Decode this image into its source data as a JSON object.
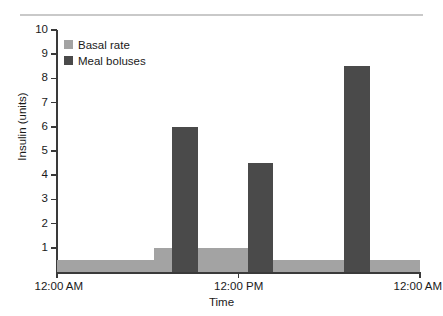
{
  "chart_data": {
    "type": "bar",
    "title": "",
    "xlabel": "Time",
    "ylabel": "Insulin (units)",
    "ylim": [
      0,
      10
    ],
    "y_ticks": [
      1,
      2,
      3,
      4,
      5,
      6,
      7,
      8,
      9,
      10
    ],
    "y_tick_labels": [
      "1",
      "2",
      "3",
      "4",
      "5",
      "6",
      "7",
      "8",
      "9",
      "10"
    ],
    "grid": false,
    "legend_position": "upper-left",
    "x_axis": {
      "label": "Time",
      "tick_labels": [
        "12:00 AM",
        "12:00 PM",
        "12:00 AM"
      ],
      "tick_positions_hours": [
        0,
        12,
        24
      ],
      "range_hours": [
        0,
        24
      ]
    },
    "series": [
      {
        "name": "Basal rate",
        "type": "step-band",
        "color": "#a3a3a3",
        "segments": [
          {
            "start_hour": 0.0,
            "end_hour": 6.4,
            "value": 0.5
          },
          {
            "start_hour": 6.4,
            "end_hour": 12.6,
            "value": 1.0
          },
          {
            "start_hour": 12.6,
            "end_hour": 24.0,
            "value": 0.5
          }
        ]
      },
      {
        "name": "Meal boluses",
        "type": "bar",
        "color": "#4a4a4a",
        "bars": [
          {
            "start_hour": 7.6,
            "end_hour": 9.3,
            "value": 6.0
          },
          {
            "start_hour": 12.6,
            "end_hour": 14.3,
            "value": 4.5
          },
          {
            "start_hour": 19.0,
            "end_hour": 20.7,
            "value": 8.5
          }
        ]
      }
    ],
    "legend": [
      {
        "label": "Basal rate",
        "color": "#a3a3a3"
      },
      {
        "label": "Meal boluses",
        "color": "#4a4a4a"
      }
    ]
  },
  "colors": {
    "basal": "#a3a3a3",
    "bolus": "#4a4a4a",
    "axis": "#3a3a3a",
    "rule": "#c9c9c9",
    "background": "#ffffff",
    "text": "#1a1a1a"
  }
}
